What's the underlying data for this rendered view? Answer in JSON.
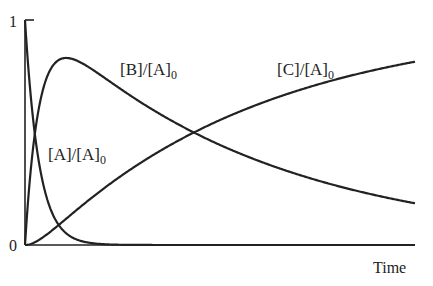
{
  "chart_data": {
    "type": "line",
    "title": "",
    "xlabel": "Time",
    "ylabel": "",
    "ylim": [
      0,
      1
    ],
    "yticks": [
      "0",
      "1"
    ],
    "grid": false,
    "legend": "inline curve labels",
    "x": [
      0,
      0.02,
      0.05,
      0.1,
      0.15,
      0.2,
      0.3,
      0.4,
      0.5,
      0.6,
      0.7,
      0.8,
      0.9,
      1.0
    ],
    "series": [
      {
        "name": "[A]/[A]0",
        "label_main": "[A]/[A]",
        "label_sub": "0",
        "values": [
          1.0,
          0.6,
          0.28,
          0.08,
          0.025,
          0.008,
          0.001,
          0,
          0,
          0,
          0,
          0,
          0,
          0
        ]
      },
      {
        "name": "[B]/[A]0",
        "label_main": "[B]/[A]",
        "label_sub": "0",
        "values": [
          0,
          0.38,
          0.66,
          0.76,
          0.74,
          0.69,
          0.6,
          0.52,
          0.44,
          0.37,
          0.31,
          0.26,
          0.21,
          0.17
        ]
      },
      {
        "name": "[C]/[A]0",
        "label_main": "[C]/[A]",
        "label_sub": "0",
        "values": [
          0,
          0.02,
          0.06,
          0.16,
          0.24,
          0.3,
          0.4,
          0.48,
          0.56,
          0.63,
          0.69,
          0.74,
          0.79,
          0.8
        ]
      }
    ]
  }
}
